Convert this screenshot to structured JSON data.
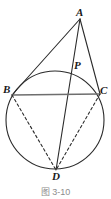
{
  "figure": {
    "caption": "图 3-10",
    "stroke_color": "#2b2b2b",
    "chord_color": "#6e6e6e",
    "background": "#ffffff",
    "labels": {
      "A": "A",
      "P": "P",
      "B": "B",
      "C": "C",
      "D": "D"
    },
    "points": {
      "A": {
        "x": 80,
        "y": 19
      },
      "P": {
        "x": 73,
        "y": 70
      },
      "B": {
        "x": 12,
        "y": 95
      },
      "C": {
        "x": 100,
        "y": 94
      },
      "D": {
        "x": 56,
        "y": 170
      }
    },
    "circle": {
      "cx": 55,
      "cy": 120,
      "r": 49
    },
    "segments": [
      {
        "name": "AB",
        "from": "A",
        "to": "B",
        "style": "solid"
      },
      {
        "name": "AC",
        "from": "A",
        "to": "C",
        "style": "solid"
      },
      {
        "name": "AD",
        "from": "A",
        "to": "D",
        "style": "solid"
      },
      {
        "name": "BC",
        "from": "B",
        "to": "C",
        "style": "solid"
      },
      {
        "name": "BD",
        "from": "B",
        "to": "D",
        "style": "dashed"
      },
      {
        "name": "CD",
        "from": "C",
        "to": "D",
        "style": "dashed"
      }
    ]
  }
}
